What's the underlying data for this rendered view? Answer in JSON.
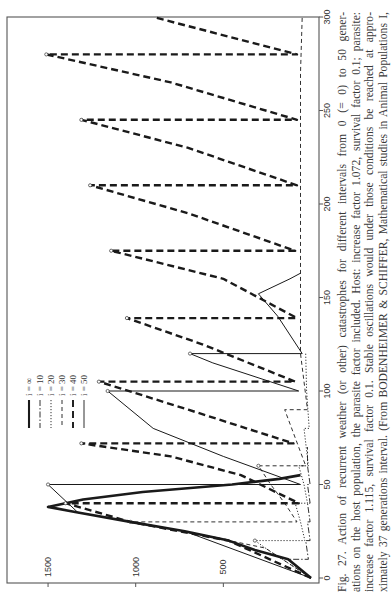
{
  "figure": {
    "number": "Fig. 27.",
    "caption_lines": [
      "Fig. 27.   Action of recurrent weather (or other) catastrophes for different intervals from 0 (= 0) to 50 gener-",
      "ations on the host population, the parasite factor included. Host: increase factor 1.072, survival factor 0.1; parasite:",
      "increase factor 1.115, survival factor 0.1.  Stable oscillations would under those conditions be reached at appro-",
      "ximately 37 generations interval. (From BODENHEIMER & SCHIFFER, Mathematical studies in Animal Populations I,"
    ]
  },
  "chart_data": {
    "type": "line",
    "orientation": "rotated 90° counter-clockwise on the page (generations run bottom-to-top on the right edge, host population runs right-to-left along the bottom edge)",
    "xlabel": "Generations",
    "ylabel": "Host population",
    "xlim": [
      0,
      300
    ],
    "ylim": [
      0,
      1500
    ],
    "x_ticks": [
      0,
      50,
      100,
      150,
      200,
      250,
      300
    ],
    "y_ticks": [
      500,
      1000,
      1500
    ],
    "grid": false,
    "legend_position": "lower-left of rotated page (top-left of unrotated plot)",
    "legend": [
      {
        "label": "i = ∞",
        "style": "thick solid"
      },
      {
        "label": "i = 10",
        "style": "dash-dot"
      },
      {
        "label": "i = 20",
        "style": "dotted"
      },
      {
        "label": "i = 30",
        "style": "thin dashed"
      },
      {
        "label": "i = 40",
        "style": "thick dashed"
      },
      {
        "label": "i = 50",
        "style": "thin solid"
      }
    ],
    "series": [
      {
        "name": "i = ∞",
        "points": [
          [
            0,
            0
          ],
          [
            10,
            130
          ],
          [
            15,
            320
          ],
          [
            20,
            470
          ],
          [
            25,
            720
          ],
          [
            30,
            1030
          ],
          [
            35,
            1330
          ],
          [
            38,
            1500
          ],
          [
            42,
            1300
          ],
          [
            46,
            960
          ],
          [
            50,
            450
          ],
          [
            53,
            180
          ],
          [
            55,
            60
          ]
        ]
      },
      {
        "name": "i = 10",
        "points": [
          [
            0,
            0
          ],
          [
            8,
            110
          ],
          [
            10,
            130
          ],
          [
            10,
            15
          ],
          [
            20,
            30
          ],
          [
            20,
            5
          ],
          [
            30,
            20
          ],
          [
            30,
            5
          ],
          [
            40,
            20
          ],
          [
            40,
            5
          ],
          [
            50,
            20
          ],
          [
            50,
            5
          ],
          [
            60,
            20
          ],
          [
            70,
            20
          ]
        ]
      },
      {
        "name": "i = 20",
        "points": [
          [
            0,
            0
          ],
          [
            14,
            230
          ],
          [
            20,
            320
          ],
          [
            20,
            35
          ],
          [
            30,
            60
          ],
          [
            40,
            90
          ],
          [
            40,
            20
          ],
          [
            50,
            40
          ],
          [
            60,
            70
          ],
          [
            60,
            15
          ],
          [
            80,
            40
          ],
          [
            80,
            10
          ],
          [
            100,
            25
          ],
          [
            120,
            30
          ]
        ]
      },
      {
        "name": "i = 30",
        "points": [
          [
            0,
            0
          ],
          [
            16,
            260
          ],
          [
            25,
            720
          ],
          [
            30,
            1030
          ],
          [
            30,
            80
          ],
          [
            40,
            150
          ],
          [
            50,
            230
          ],
          [
            60,
            300
          ],
          [
            60,
            30
          ],
          [
            75,
            90
          ],
          [
            90,
            150
          ],
          [
            90,
            20
          ],
          [
            120,
            60
          ],
          [
            150,
            60
          ],
          [
            180,
            60
          ],
          [
            210,
            60
          ],
          [
            240,
            60
          ],
          [
            270,
            60
          ],
          [
            300,
            50
          ]
        ]
      },
      {
        "name": "i = 40",
        "points": [
          [
            0,
            0
          ],
          [
            20,
            470
          ],
          [
            30,
            1030
          ],
          [
            40,
            1400
          ],
          [
            40,
            70
          ],
          [
            55,
            400
          ],
          [
            65,
            800
          ],
          [
            72,
            1310
          ],
          [
            72,
            100
          ],
          [
            90,
            700
          ],
          [
            105,
            1210
          ],
          [
            105,
            90
          ],
          [
            125,
            620
          ],
          [
            139,
            1050
          ],
          [
            139,
            80
          ],
          [
            160,
            500
          ],
          [
            175,
            1140
          ],
          [
            175,
            90
          ],
          [
            195,
            700
          ],
          [
            210,
            1260
          ],
          [
            210,
            80
          ],
          [
            230,
            700
          ],
          [
            245,
            1310
          ],
          [
            245,
            80
          ],
          [
            265,
            800
          ],
          [
            280,
            1510
          ],
          [
            280,
            80
          ],
          [
            300,
            900
          ]
        ]
      },
      {
        "name": "i = 50",
        "points": [
          [
            0,
            0
          ],
          [
            25,
            720
          ],
          [
            35,
            1330
          ],
          [
            50,
            1500
          ],
          [
            50,
            60
          ],
          [
            65,
            500
          ],
          [
            80,
            900
          ],
          [
            100,
            1160
          ],
          [
            100,
            70
          ],
          [
            115,
            560
          ],
          [
            120,
            690
          ],
          [
            120,
            50
          ],
          [
            140,
            190
          ],
          [
            152,
            300
          ],
          [
            160,
            120
          ],
          [
            163,
            60
          ]
        ]
      }
    ]
  },
  "axes_labels": {
    "x_tick_labels": [
      "0",
      "50",
      "100",
      "150",
      "200",
      "250",
      "300"
    ],
    "y_tick_labels": [
      "500",
      "1000",
      "1500"
    ]
  },
  "legend_labels": [
    "i = ∞",
    "i = 10",
    "i = 20",
    "i = 30",
    "i = 40",
    "i = 50"
  ]
}
